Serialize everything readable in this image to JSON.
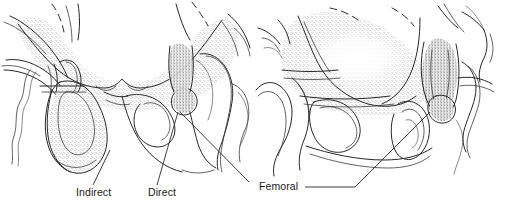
{
  "figure": {
    "background_color": "#ffffff",
    "ink_color": "#262626",
    "width": 505,
    "height": 209,
    "style": "pen-and-ink stippled medical line drawing"
  },
  "panels": [
    {
      "id": "left-panel",
      "name": "inguinal-hernia-panel",
      "description": "Anterior view of pelvis and inguinal region showing indirect and direct inguinal hernia sacs",
      "labels": [
        "Indirect",
        "Direct"
      ]
    },
    {
      "id": "right-panel",
      "name": "femoral-hernia-panel",
      "description": "Anterior view of pelvis and inguinal region showing femoral hernia",
      "labels": [
        "Femoral"
      ]
    }
  ],
  "labels": {
    "indirect": {
      "text": "Indirect",
      "x": 76,
      "y": 196
    },
    "direct": {
      "text": "Direct",
      "x": 148,
      "y": 196
    },
    "femoral": {
      "text": "Femoral",
      "x": 259,
      "y": 190
    }
  }
}
